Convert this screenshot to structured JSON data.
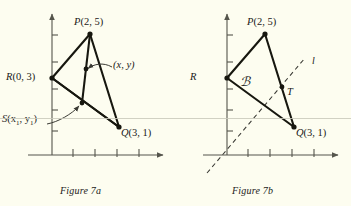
{
  "page": {
    "background_color": "#fdfdf0",
    "ink_color": "#1a1a18",
    "scanline_color": "#c9c9bb"
  },
  "figures": [
    {
      "id": "figure-7a",
      "caption": "Figure 7a",
      "axis": {
        "x_ticks": 4,
        "y_ticks": 5,
        "has_arrowheads": true
      },
      "points": [
        {
          "name": "P",
          "label": "P",
          "coords": "(2, 5)"
        },
        {
          "name": "R",
          "label": "R",
          "coords": "(0, 3)"
        },
        {
          "name": "Q",
          "label": "Q",
          "coords": "(3, 1)"
        }
      ],
      "annotations": [
        {
          "name": "midpoint-xy",
          "text": "(x, y)"
        },
        {
          "name": "point-s",
          "label": "S",
          "coords_html": "(x<sub>1</sub>, y<sub>1</sub>)"
        }
      ]
    },
    {
      "id": "figure-7b",
      "caption": "Figure 7b",
      "axis": {
        "x_ticks": 4,
        "y_ticks": 5,
        "has_arrowheads": true
      },
      "points": [
        {
          "name": "P",
          "label": "P",
          "coords": "(2, 5)"
        },
        {
          "name": "R",
          "label": "R",
          "coords": ""
        },
        {
          "name": "Q",
          "label": "Q",
          "coords": "(3, 1)"
        },
        {
          "name": "T",
          "label": "T",
          "coords": ""
        }
      ],
      "annotations": [
        {
          "name": "region-k",
          "text": "ℬ"
        },
        {
          "name": "line-l",
          "text": "l"
        }
      ]
    }
  ]
}
